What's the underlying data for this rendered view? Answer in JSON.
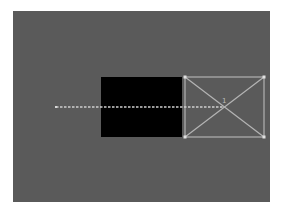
{
  "canvas": {
    "background": "#5a5a5a",
    "frame": {
      "x": 13,
      "y": 11,
      "width": 257,
      "height": 191
    }
  },
  "black_rect": {
    "x": 101,
    "y": 77,
    "width": 81,
    "height": 60,
    "color": "#000000"
  },
  "placeholder_box": {
    "x": 185,
    "y": 77,
    "width": 79,
    "height": 60,
    "stroke": "#9a9a9a",
    "label": "1"
  },
  "guide_line": {
    "x1": 56,
    "y1": 107,
    "x2": 224,
    "y2": 107,
    "style": "dashed",
    "color": "#c8c8c8"
  }
}
